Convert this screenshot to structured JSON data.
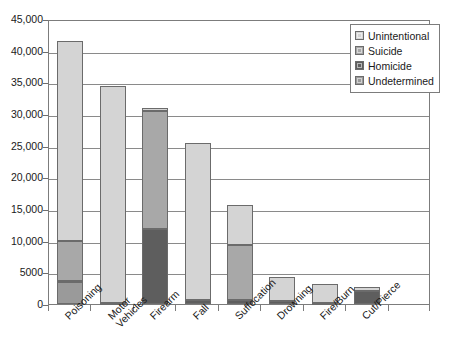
{
  "chart_data": {
    "type": "bar",
    "subtype": "stacked-vertical",
    "title": "",
    "subtitle": "",
    "xlabel": "",
    "ylabel": "",
    "ylim": [
      0,
      45000
    ],
    "ytick_step": 5000,
    "ytick_labels": [
      "0",
      "5000",
      "10,000",
      "15,000",
      "20,000",
      "25,000",
      "30,000",
      "35,000",
      "40,000",
      "45,000"
    ],
    "ytick_values": [
      0,
      5000,
      10000,
      15000,
      20000,
      25000,
      30000,
      35000,
      40000,
      45000
    ],
    "grid": "horizontal",
    "legend_position": "top-right",
    "categories": [
      "Poisoning",
      "Motor Vehicles",
      "Firearm",
      "Fall",
      "Suffocation",
      "Drowning",
      "Fire/Burn",
      "Cut/Pierce"
    ],
    "category_labels_multiline": [
      [
        "Poisoning"
      ],
      [
        "Motor",
        "Vehicles"
      ],
      [
        "Firearm"
      ],
      [
        "Fall"
      ],
      [
        "Suffocation"
      ],
      [
        "Drowning"
      ],
      [
        "Fire/Burn"
      ],
      [
        "Cut/Pierce"
      ]
    ],
    "series": [
      {
        "name": "Undetermined",
        "color": "#9a9a9a",
        "values": [
          3400,
          100,
          0,
          0,
          0,
          0,
          0,
          0
        ]
      },
      {
        "name": "Homicide",
        "color": "#5e5e5e",
        "values": [
          300,
          0,
          11800,
          600,
          700,
          400,
          200,
          2000
        ]
      },
      {
        "name": "Suicide",
        "color": "#a8a8a8",
        "values": [
          6300,
          0,
          18600,
          0,
          8600,
          0,
          0,
          0
        ]
      },
      {
        "name": "Unintentional",
        "color": "#d4d4d4",
        "values": [
          31500,
          34400,
          600,
          24900,
          6400,
          3800,
          2900,
          700
        ]
      }
    ],
    "totals": [
      41500,
      34500,
      31000,
      25500,
      15700,
      4200,
      3100,
      2700
    ],
    "legend_entries": [
      {
        "label": "Unintentional",
        "color": "#d4d4d4"
      },
      {
        "label": "Suicide",
        "color": "#a8a8a8"
      },
      {
        "label": "Homicide",
        "color": "#5e5e5e"
      },
      {
        "label": "Undetermined",
        "color": "#9a9a9a"
      }
    ]
  },
  "colors": {
    "axis": "#7c7c7c",
    "grid": "#8a8a8a",
    "text": "#1a1a1a",
    "bar_border": "#6b6b6b",
    "background": "#ffffff"
  }
}
